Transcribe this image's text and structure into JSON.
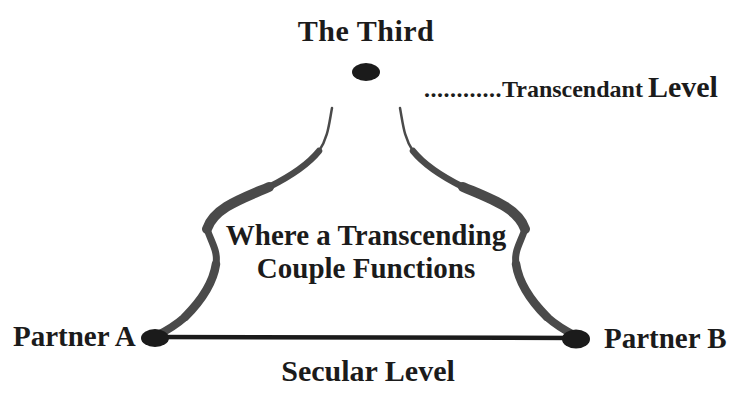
{
  "figure": {
    "top_node": {
      "label": "The Third"
    },
    "transcendant_level": {
      "leader_dots": "............",
      "word": "Transcendant",
      "suffix": "Level"
    },
    "center_text": {
      "line1": "Where a Transcending",
      "line2": "Couple Functions"
    },
    "bottom": {
      "partner_a": "Partner A",
      "partner_b": "Partner B",
      "level_label": "Secular Level"
    }
  },
  "colors": {
    "background": "#ffffff",
    "ink": "#1b1b1b",
    "curve_ink": "#3d3d3d"
  }
}
